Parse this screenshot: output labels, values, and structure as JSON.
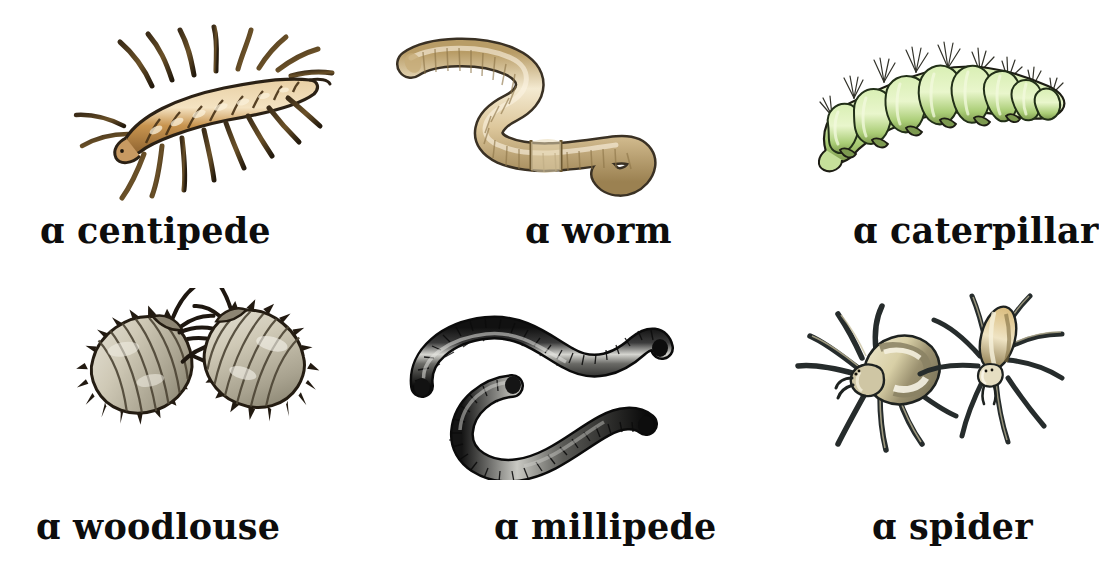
{
  "page": {
    "background_color": "#ffffff",
    "text_color": "#0d0d0d",
    "columns": 3,
    "rows": 2
  },
  "palette": {
    "centipede_body": "#c08c4e",
    "centipede_highlight": "#e8cfa4",
    "centipede_outline": "#2b2115",
    "worm_body": "#d8c196",
    "worm_highlight": "#f2e7cc",
    "worm_outline": "#3a3124",
    "caterpillar_body": "#c9e39b",
    "caterpillar_highlight": "#e6f5c6",
    "caterpillar_shadow": "#8caköp",
    "caterpillar_outline": "#1d1d14",
    "woodlouse_body": "#b9b3a1",
    "woodlouse_highlight": "#e3e0d4",
    "woodlouse_outline": "#241c12",
    "millipede_body": "#2a2a2a",
    "millipede_highlight": "#cfcfcb",
    "millipede_outline": "#0c0c0c",
    "spider_body": "#d9cfa9",
    "spider_abdomen": "#f3efd9",
    "spider_leg": "#2f3434",
    "spider_outline": "#15181a"
  },
  "items": [
    {
      "id": "centipede",
      "label": "ɑ centipede",
      "creature": "centipede",
      "icon": "centipede-illustration",
      "row": 1,
      "column": 1,
      "count": 1,
      "colors": {
        "body": "#c08c4e",
        "outline": "#2b2115"
      }
    },
    {
      "id": "worm",
      "label": "ɑ worm",
      "creature": "worm",
      "icon": "worm-illustration",
      "row": 1,
      "column": 2,
      "count": 1,
      "colors": {
        "body": "#d8c196",
        "outline": "#3a3124"
      }
    },
    {
      "id": "caterpillar",
      "label": "ɑ caterpillar",
      "creature": "caterpillar",
      "icon": "caterpillar-illustration",
      "row": 1,
      "column": 3,
      "count": 1,
      "colors": {
        "body": "#c9e39b",
        "outline": "#1d1d14"
      }
    },
    {
      "id": "woodlouse",
      "label": "ɑ woodlouse",
      "creature": "woodlouse",
      "icon": "woodlouse-illustration",
      "row": 2,
      "column": 1,
      "count": 2,
      "colors": {
        "body": "#b9b3a1",
        "outline": "#241c12"
      }
    },
    {
      "id": "millipede",
      "label": "ɑ millipede",
      "creature": "millipede",
      "icon": "millipede-illustration",
      "row": 2,
      "column": 2,
      "count": 1,
      "colors": {
        "body": "#2a2a2a",
        "outline": "#0c0c0c"
      }
    },
    {
      "id": "spider",
      "label": "ɑ spider",
      "creature": "spider",
      "icon": "spider-illustration",
      "row": 2,
      "column": 3,
      "count": 2,
      "colors": {
        "body": "#d9cfa9",
        "outline": "#15181a"
      }
    }
  ]
}
